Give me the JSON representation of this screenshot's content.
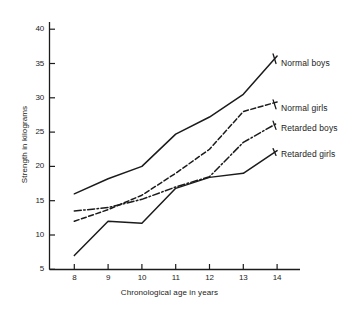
{
  "chart_data": {
    "type": "line",
    "title": "",
    "xlabel": "Chronological age in years",
    "ylabel": "Strength in kilograms",
    "x": [
      8,
      9,
      10,
      11,
      12,
      13,
      14
    ],
    "xtick_labels": [
      "8",
      "9",
      "10",
      "11",
      "12",
      "13",
      "14"
    ],
    "ytick_labels": [
      "5",
      "10",
      "15",
      "20",
      "25",
      "30",
      "35",
      "40"
    ],
    "xlim": [
      7.6,
      14.6
    ],
    "ylim": [
      4.2,
      41.5
    ],
    "grid": false,
    "legend_position": "right-inline-labels",
    "series": [
      {
        "name": "Normal boys",
        "style": "solid",
        "values": [
          16.0,
          18.2,
          20.0,
          24.7,
          27.2,
          30.5,
          36.1
        ],
        "label_value": 35.0
      },
      {
        "name": "Normal girls",
        "style": "dashed",
        "values": [
          12.0,
          13.7,
          15.8,
          19.0,
          22.5,
          28.0,
          29.4
        ],
        "label_value": 28.4
      },
      {
        "name": "Retarded boys",
        "style": "dash-dot",
        "values": [
          13.5,
          14.0,
          15.2,
          17.0,
          18.5,
          23.5,
          26.3
        ],
        "label_value": 25.4
      },
      {
        "name": "Retarded girls",
        "style": "solid",
        "values": [
          7.0,
          12.0,
          11.7,
          16.8,
          18.4,
          19.0,
          22.3
        ],
        "label_value": 21.6
      }
    ]
  },
  "colors": {
    "ink": "#1b1b1b",
    "background": "#ffffff"
  }
}
